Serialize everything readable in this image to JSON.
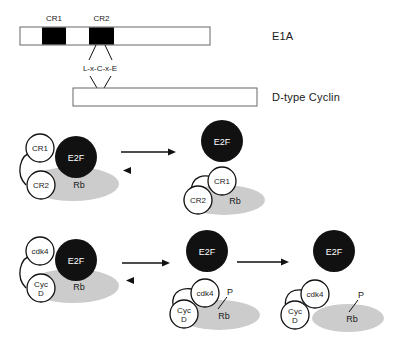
{
  "figure": {
    "domain_map": {
      "e1a_label": "E1A",
      "cyclin_label": "D-type Cyclin",
      "cr1_label": "CR1",
      "cr2_label": "CR2",
      "motif_label": "L-x-C-x-E"
    },
    "rows": [
      {
        "id": "row-e1a",
        "complexes": [
          {
            "id": "e1a-rb-e2f-bound",
            "nodes": [
              {
                "name": "cr1-circle",
                "label": "CR1",
                "shape": "circle",
                "fill": "white"
              },
              {
                "name": "cr2-circle",
                "label": "CR2",
                "shape": "circle",
                "fill": "white"
              },
              {
                "name": "e2f-circle",
                "label": "E2F",
                "shape": "circle",
                "fill": "black"
              },
              {
                "name": "rb-ellipse",
                "label": "Rb",
                "shape": "ellipse",
                "fill": "gray"
              }
            ]
          },
          {
            "id": "e1a-rb-bound-e2f-free",
            "nodes": [
              {
                "name": "e2f-circle",
                "label": "E2F",
                "shape": "circle",
                "fill": "black"
              },
              {
                "name": "cr1-circle",
                "label": "CR1",
                "shape": "circle",
                "fill": "white"
              },
              {
                "name": "cr2-circle",
                "label": "CR2",
                "shape": "circle",
                "fill": "white"
              },
              {
                "name": "rb-ellipse",
                "label": "Rb",
                "shape": "ellipse",
                "fill": "gray"
              }
            ]
          }
        ],
        "transitions": [
          {
            "id": "equilibrium-arrow-1",
            "type": "equilibrium"
          }
        ]
      },
      {
        "id": "row-cyclin",
        "complexes": [
          {
            "id": "cdk4-cycd-rb-e2f-bound",
            "nodes": [
              {
                "name": "cdk4-circle",
                "label": "cdk4",
                "shape": "circle",
                "fill": "white"
              },
              {
                "name": "cycd-circle",
                "label": "Cyc D",
                "label_line1": "Cyc",
                "label_line2": "D",
                "shape": "circle",
                "fill": "white"
              },
              {
                "name": "e2f-circle",
                "label": "E2F",
                "shape": "circle",
                "fill": "black"
              },
              {
                "name": "rb-ellipse",
                "label": "Rb",
                "shape": "ellipse",
                "fill": "gray"
              }
            ]
          },
          {
            "id": "cdk4-cycd-rb-phosphorylated-e2f-free",
            "nodes": [
              {
                "name": "e2f-circle",
                "label": "E2F",
                "shape": "circle",
                "fill": "black"
              },
              {
                "name": "cdk4-circle",
                "label": "cdk4",
                "shape": "circle",
                "fill": "white"
              },
              {
                "name": "cycd-circle",
                "label": "Cyc D",
                "label_line1": "Cyc",
                "label_line2": "D",
                "shape": "circle",
                "fill": "white"
              },
              {
                "name": "phosphate-label",
                "label": "P",
                "shape": "text"
              },
              {
                "name": "rb-ellipse",
                "label": "Rb",
                "shape": "ellipse",
                "fill": "gray"
              }
            ]
          },
          {
            "id": "rb-phosphorylated-released",
            "nodes": [
              {
                "name": "e2f-circle",
                "label": "E2F",
                "shape": "circle",
                "fill": "black"
              },
              {
                "name": "cdk4-circle",
                "label": "cdk4",
                "shape": "circle",
                "fill": "white"
              },
              {
                "name": "cycd-circle",
                "label": "Cyc D",
                "label_line1": "Cyc",
                "label_line2": "D",
                "shape": "circle",
                "fill": "white"
              },
              {
                "name": "phosphate-label",
                "label": "P",
                "shape": "text"
              },
              {
                "name": "rb-ellipse",
                "label": "Rb",
                "shape": "ellipse",
                "fill": "gray"
              }
            ]
          }
        ],
        "transitions": [
          {
            "id": "equilibrium-arrow-2",
            "type": "equilibrium"
          },
          {
            "id": "forward-arrow-1",
            "type": "forward"
          }
        ]
      }
    ],
    "colors": {
      "e2f_fill": "#111111",
      "rb_fill": "#cccccc",
      "protein_fill": "#ffffff",
      "stroke": "#111111",
      "bar_stroke": "#555555",
      "cr_block_fill": "#000000"
    }
  }
}
